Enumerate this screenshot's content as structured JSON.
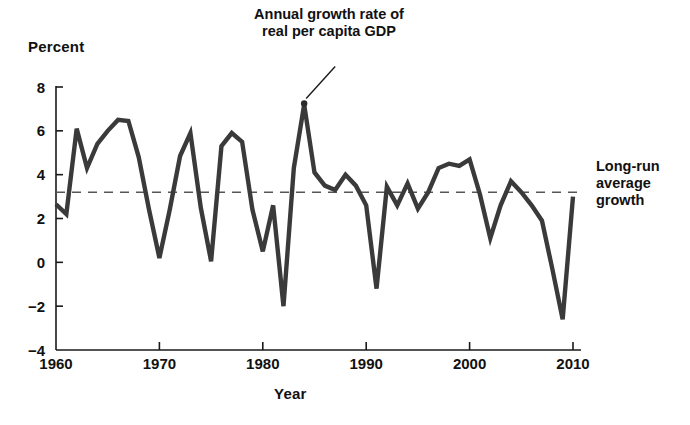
{
  "chart_data": {
    "type": "line",
    "title": "",
    "xlabel": "Year",
    "ylabel": "Percent",
    "xlim": [
      1960,
      2010
    ],
    "ylim": [
      -4,
      8
    ],
    "xticks": [
      1960,
      1970,
      1980,
      1990,
      2000,
      2010
    ],
    "yticks": [
      -4,
      -2,
      0,
      2,
      4,
      6,
      8
    ],
    "grid": false,
    "legend_position": "annotations",
    "series": [
      {
        "name": "Annual growth rate of real per capita GDP",
        "color": "#3a3a3a",
        "x": [
          1960,
          1961,
          1962,
          1963,
          1964,
          1965,
          1966,
          1967,
          1968,
          1969,
          1970,
          1971,
          1972,
          1973,
          1974,
          1975,
          1976,
          1977,
          1978,
          1979,
          1980,
          1981,
          1982,
          1983,
          1984,
          1985,
          1986,
          1987,
          1988,
          1989,
          1990,
          1991,
          1992,
          1993,
          1994,
          1995,
          1996,
          1997,
          1998,
          1999,
          2000,
          2001,
          2002,
          2003,
          2004,
          2005,
          2006,
          2007,
          2008,
          2009,
          2010
        ],
        "values": [
          2.65,
          2.2,
          6.1,
          4.3,
          5.4,
          6.0,
          6.5,
          6.45,
          4.8,
          2.4,
          0.2,
          2.4,
          4.85,
          5.9,
          2.5,
          0.05,
          5.3,
          5.9,
          5.5,
          2.4,
          0.5,
          2.6,
          -2.0,
          4.3,
          7.2,
          4.1,
          3.5,
          3.3,
          4.0,
          3.5,
          2.6,
          -1.2,
          3.45,
          2.6,
          3.6,
          2.45,
          3.2,
          4.3,
          4.5,
          4.4,
          4.7,
          3.1,
          1.1,
          2.6,
          3.7,
          3.2,
          2.6,
          1.9,
          -0.3,
          -2.6,
          3.0
        ]
      }
    ],
    "reference_line": {
      "name": "Long-run average growth",
      "value": 3.2,
      "style": "dashed",
      "color": "#555555"
    },
    "annotations": [
      {
        "id": "series-annotation",
        "text_line1": "Annual growth rate of",
        "text_line2": "real per capita GDP",
        "points_to_year": 1984,
        "points_to_value": 7.2,
        "has_leader_line": true
      },
      {
        "id": "average-annotation",
        "text_line1": "Long-run",
        "text_line2": "average",
        "text_line3": "growth",
        "points_to_value": 3.2,
        "has_leader_line": false
      }
    ]
  },
  "axes": {
    "y_title": "Percent",
    "x_title": "Year",
    "x_tick_labels": [
      "1960",
      "1970",
      "1980",
      "1990",
      "2000",
      "2010"
    ],
    "y_tick_labels": [
      "8",
      "6",
      "4",
      "2",
      "0",
      "−2",
      "−4"
    ]
  },
  "annotations": {
    "series_label_line1": "Annual growth rate of",
    "series_label_line2": "real per capita GDP",
    "average_label_line1": "Long-run",
    "average_label_line2": "average",
    "average_label_line3": "growth"
  }
}
